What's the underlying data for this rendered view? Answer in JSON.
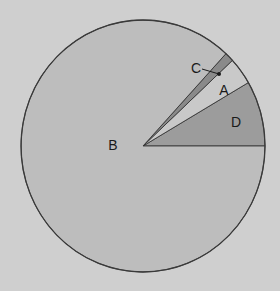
{
  "chart_data": {
    "type": "pie",
    "title": "",
    "start_angle_deg": 0,
    "direction": "counterclockwise",
    "slices": [
      {
        "label": "D",
        "value": 8.4,
        "color": "#9c9c9c"
      },
      {
        "label": "A",
        "value": 3.5,
        "color": "#c9c9c9"
      },
      {
        "label": "C",
        "value": 1.2,
        "color": "#8a8a8a"
      },
      {
        "label": "B",
        "value": 86.9,
        "color": "#bdbdbd"
      }
    ],
    "labels_position": [
      {
        "label": "B",
        "x": 113,
        "y": 145
      },
      {
        "label": "C",
        "x": 196,
        "y": 68,
        "leader_to": {
          "x": 219,
          "y": 74
        }
      },
      {
        "label": "A",
        "x": 224,
        "y": 90
      },
      {
        "label": "D",
        "x": 236,
        "y": 122
      }
    ],
    "legend": "none"
  },
  "style": {
    "background": "#cfcfcf",
    "outline": "#3a3a3a"
  }
}
